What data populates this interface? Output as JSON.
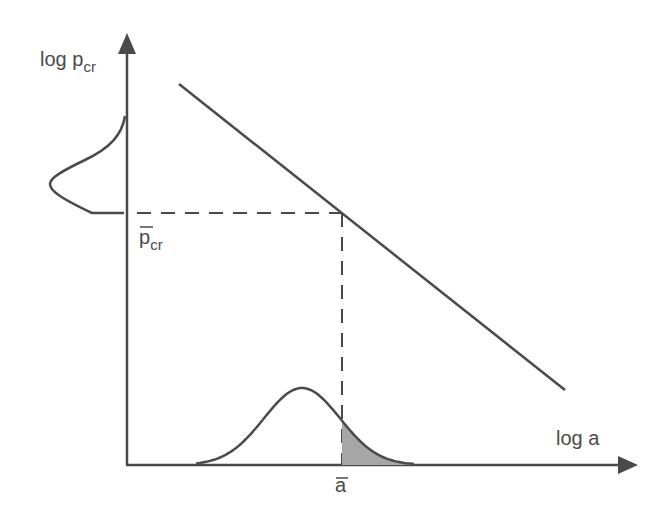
{
  "diagram": {
    "y_axis_label": "log p",
    "y_axis_label_sub": "cr",
    "x_axis_label": "log a",
    "p_mean_label": "p",
    "p_mean_label_sub": "cr",
    "a_mean_label": "a",
    "colors": {
      "line": "#4a4a4a",
      "shade": "#a6a6a6",
      "background": "#ffffff"
    },
    "elements": [
      "vertical axis log p_cr",
      "horizontal axis log a",
      "descending line log p_cr vs log a",
      "distribution of p_cr on vertical axis",
      "distribution of a on horizontal axis with shaded tail beyond mean a",
      "dashed projection lines from mean a and mean p_cr to line"
    ]
  }
}
